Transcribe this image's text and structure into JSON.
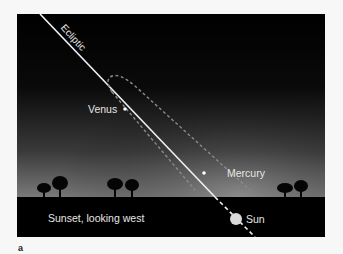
{
  "figure": {
    "panel_letter": "a",
    "caption": "Sunset, looking west",
    "labels": {
      "ecliptic": "Ecliptic",
      "venus": "Venus",
      "mercury": "Mercury",
      "sun": "Sun"
    },
    "colors": {
      "sky_top": "#000000",
      "sky_horizon": "#7a7a7a",
      "ground": "#000000",
      "line": "#f0f0f0",
      "ellipse_dash": "#8a8a8a",
      "sun": "#d9d9d9",
      "text": "#e6e6e6",
      "page_background": "#f7f7f7"
    },
    "objects": [
      {
        "name": "Venus",
        "x": 125,
        "y": 109
      },
      {
        "name": "Mercury",
        "x": 204,
        "y": 173
      },
      {
        "name": "Sun",
        "x": 236,
        "y": 219
      }
    ]
  }
}
